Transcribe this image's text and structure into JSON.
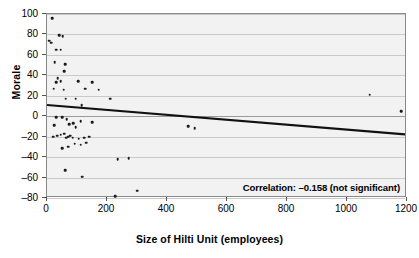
{
  "chart_data": {
    "type": "scatter",
    "title": "",
    "xlabel": "Size of Hilti Unit (employees)",
    "ylabel": "Morale",
    "xlim": [
      0,
      1200
    ],
    "ylim": [
      -80,
      100
    ],
    "xticks": [
      0,
      200,
      400,
      600,
      800,
      1000,
      1200
    ],
    "yticks": [
      -80,
      -60,
      -40,
      -20,
      0,
      20,
      40,
      60,
      80,
      100
    ],
    "grid": true,
    "legend": null,
    "annotation": "Correlation: –0.158 (not significant)",
    "correlation": -0.158,
    "significance": "not significant",
    "trendline": {
      "type": "linear",
      "x_start": 0,
      "y_start": 10,
      "x_end": 1200,
      "y_end": -19
    },
    "points": [
      [
        8,
        74
      ],
      [
        14,
        72
      ],
      [
        18,
        96
      ],
      [
        40,
        79
      ],
      [
        52,
        78
      ],
      [
        30,
        65
      ],
      [
        46,
        65
      ],
      [
        25,
        53
      ],
      [
        60,
        51
      ],
      [
        58,
        44
      ],
      [
        36,
        37
      ],
      [
        30,
        33
      ],
      [
        22,
        27
      ],
      [
        46,
        34
      ],
      [
        56,
        26
      ],
      [
        104,
        34
      ],
      [
        128,
        27
      ],
      [
        150,
        33
      ],
      [
        172,
        26
      ],
      [
        62,
        17
      ],
      [
        96,
        17
      ],
      [
        116,
        11
      ],
      [
        210,
        17
      ],
      [
        1075,
        21
      ],
      [
        1180,
        5
      ],
      [
        30,
        -1
      ],
      [
        50,
        -1
      ],
      [
        66,
        -3
      ],
      [
        112,
        -5
      ],
      [
        150,
        -6
      ],
      [
        24,
        -9
      ],
      [
        74,
        -8
      ],
      [
        88,
        -7
      ],
      [
        96,
        -11
      ],
      [
        20,
        -20
      ],
      [
        34,
        -19
      ],
      [
        46,
        -18
      ],
      [
        58,
        -17
      ],
      [
        64,
        -21
      ],
      [
        70,
        -20
      ],
      [
        78,
        -19
      ],
      [
        86,
        -21
      ],
      [
        106,
        -22
      ],
      [
        124,
        -21
      ],
      [
        140,
        -20
      ],
      [
        92,
        -27
      ],
      [
        112,
        -28
      ],
      [
        130,
        -26
      ],
      [
        50,
        -31
      ],
      [
        70,
        -30
      ],
      [
        60,
        -53
      ],
      [
        118,
        -59
      ],
      [
        236,
        -42
      ],
      [
        272,
        -41
      ],
      [
        300,
        -73
      ],
      [
        228,
        -78
      ],
      [
        470,
        -10
      ],
      [
        492,
        -12
      ]
    ]
  }
}
